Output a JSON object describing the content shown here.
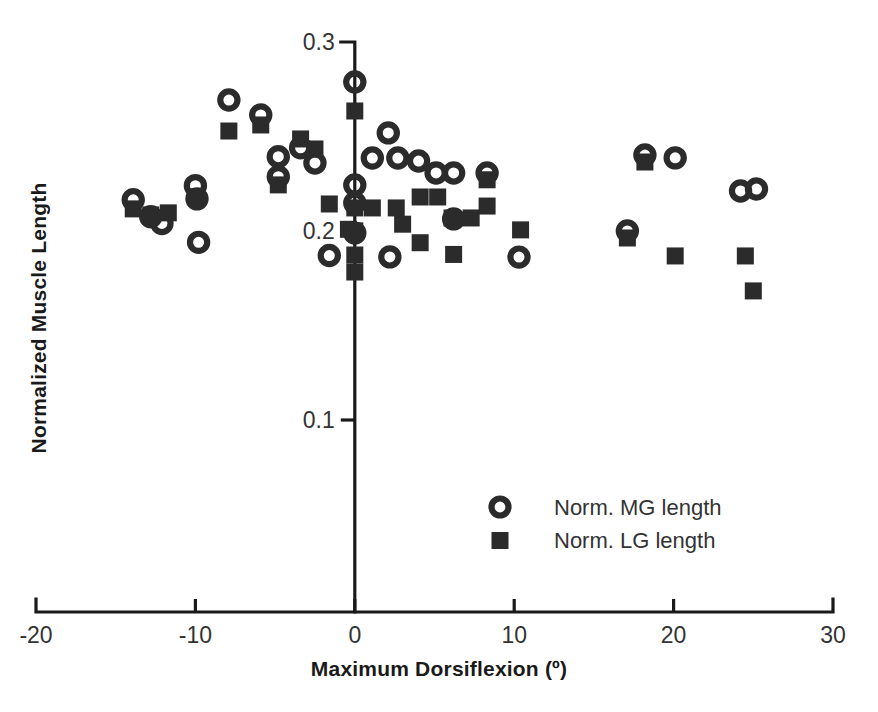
{
  "chart_data": {
    "type": "scatter",
    "title": "",
    "xlabel": "Maximum Dorsiflexion (º)",
    "ylabel": "Normalized Muscle Length",
    "xlim": [
      -20,
      30
    ],
    "ylim": [
      0.082,
      0.305
    ],
    "xticks": [
      -20,
      -10,
      0,
      10,
      20,
      30
    ],
    "xticklabels": [
      "-20",
      "-10",
      "0",
      "10",
      "20",
      "30"
    ],
    "yticks": [
      0.1,
      0.2,
      0.3
    ],
    "yticklabels": [
      "0.1",
      "0.2",
      "0.3"
    ],
    "grid": false,
    "legend_position": "inside-lower-right",
    "series": [
      {
        "name": "Norm. MG length",
        "marker": "open-circle",
        "color": "#2b2b2b",
        "points": [
          [
            -13.9,
            0.2165
          ],
          [
            -12.8,
            0.2075
          ],
          [
            -12.1,
            0.204
          ],
          [
            -10.0,
            0.224
          ],
          [
            -9.9,
            0.217
          ],
          [
            -9.8,
            0.194
          ],
          [
            -7.9,
            0.2693
          ],
          [
            -5.9,
            0.2614
          ],
          [
            -4.8,
            0.2393
          ],
          [
            -4.8,
            0.2287
          ],
          [
            -3.4,
            0.244
          ],
          [
            -2.5,
            0.236
          ],
          [
            -1.6,
            0.187
          ],
          [
            0.0,
            0.2788
          ],
          [
            0.0,
            0.2243
          ],
          [
            0.0,
            0.2148
          ],
          [
            0.0,
            0.1989
          ],
          [
            2.1,
            0.2519
          ],
          [
            2.2,
            0.1863
          ],
          [
            1.1,
            0.2386
          ],
          [
            2.7,
            0.2386
          ],
          [
            4.0,
            0.237
          ],
          [
            5.1,
            0.2307
          ],
          [
            6.2,
            0.2307
          ],
          [
            6.2,
            0.2064
          ],
          [
            8.3,
            0.2307
          ],
          [
            10.3,
            0.1862
          ],
          [
            18.2,
            0.2402
          ],
          [
            20.1,
            0.2387
          ],
          [
            17.1,
            0.2
          ],
          [
            24.2,
            0.2212
          ],
          [
            25.2,
            0.2222
          ]
        ]
      },
      {
        "name": "Norm. LG length",
        "marker": "filled-square",
        "color": "#2b2b2b",
        "points": [
          [
            -13.9,
            0.2117
          ],
          [
            -12.8,
            0.2085
          ],
          [
            -11.7,
            0.2096
          ],
          [
            -10.0,
            0.2181
          ],
          [
            -7.9,
            0.2529
          ],
          [
            -5.9,
            0.2561
          ],
          [
            -4.8,
            0.2244
          ],
          [
            -3.4,
            0.2487
          ],
          [
            -2.5,
            0.2434
          ],
          [
            -1.6,
            0.2143
          ],
          [
            -0.4,
            0.2009
          ],
          [
            0.0,
            0.2635
          ],
          [
            0.0,
            0.2122
          ],
          [
            0.0,
            0.2001
          ],
          [
            0.0,
            0.1873
          ],
          [
            0.0,
            0.1783
          ],
          [
            1.1,
            0.2122
          ],
          [
            2.6,
            0.2122
          ],
          [
            3.0,
            0.2036
          ],
          [
            4.1,
            0.218
          ],
          [
            5.2,
            0.218
          ],
          [
            4.1,
            0.1938
          ],
          [
            6.1,
            0.2069
          ],
          [
            7.3,
            0.2069
          ],
          [
            8.3,
            0.2271
          ],
          [
            8.3,
            0.2132
          ],
          [
            6.2,
            0.1876
          ],
          [
            10.4,
            0.2006
          ],
          [
            18.2,
            0.2365
          ],
          [
            17.1,
            0.1963
          ],
          [
            20.1,
            0.1868
          ],
          [
            24.5,
            0.1868
          ],
          [
            25.0,
            0.1683
          ]
        ]
      }
    ]
  },
  "axes": {
    "x_axis_name": "maximum-dorsiflexion-axis",
    "y_axis_name": "normalized-muscle-length-axis"
  },
  "legend": {
    "entries": [
      {
        "label": "Norm. MG length",
        "marker": "open-circle"
      },
      {
        "label": "Norm. LG length",
        "marker": "filled-square"
      }
    ]
  },
  "colors": {
    "marker": "#2b2b2b",
    "axis": "#1a1a1a",
    "text": "#333333",
    "background": "#ffffff"
  }
}
